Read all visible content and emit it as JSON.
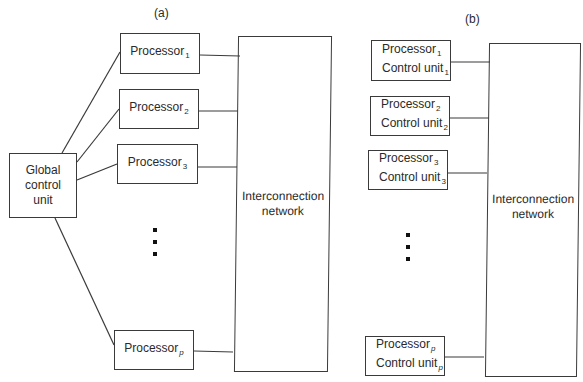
{
  "panels": [
    {
      "caption": "(a)",
      "global_control": {
        "line1": "Global",
        "line2": "control",
        "line3": "unit"
      },
      "processors": [
        {
          "label": "Processor",
          "sub": "1"
        },
        {
          "label": "Processor",
          "sub": "2"
        },
        {
          "label": "Processor",
          "sub": "3"
        },
        {
          "label": "Processor",
          "sub": "p"
        }
      ],
      "network": {
        "line1": "Interconnection",
        "line2": "network"
      }
    },
    {
      "caption": "(b)",
      "processors": [
        {
          "label": "Processor",
          "sub": "1",
          "cu_label": "Control unit",
          "cu_sub": "1"
        },
        {
          "label": "Processor",
          "sub": "2",
          "cu_label": "Control unit",
          "cu_sub": "2"
        },
        {
          "label": "Processor",
          "sub": "3",
          "cu_label": "Control unit",
          "cu_sub": "3"
        },
        {
          "label": "Processor",
          "sub": "p",
          "cu_label": "Control unit",
          "cu_sub": "p"
        }
      ],
      "network": {
        "line1": "Interconnection",
        "line2": "network"
      }
    }
  ],
  "colors": {
    "stroke": "#3a3a3a",
    "background": "#ffffff",
    "text": "#2a2a2a"
  }
}
